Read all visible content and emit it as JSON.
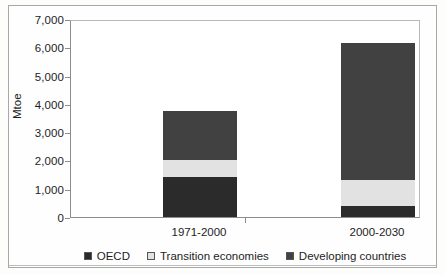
{
  "chart_data": {
    "type": "bar",
    "stacked": true,
    "title": "",
    "xlabel": "",
    "ylabel": "Mtoe",
    "ylim": [
      0,
      7000
    ],
    "ytick_labels": [
      "7,000",
      "6,000",
      "5,000",
      "4,000",
      "3,000",
      "2,000",
      "1,000",
      "0"
    ],
    "ytick_values": [
      7000,
      6000,
      5000,
      4000,
      3000,
      2000,
      1000,
      0
    ],
    "grid": false,
    "legend_position": "bottom",
    "categories": [
      "1971-2000",
      "2000-2030"
    ],
    "series": [
      {
        "name": "OECD",
        "color": "#2b2b2b",
        "values": [
          1400,
          400
        ]
      },
      {
        "name": "Transition economies",
        "color": "#e2e2e2",
        "values": [
          630,
          900
        ]
      },
      {
        "name": "Developing countries",
        "color": "#414141",
        "values": [
          1720,
          4850
        ]
      }
    ],
    "totals": [
      3750,
      6150
    ]
  },
  "axis": {
    "y_title": "Mtoe"
  }
}
